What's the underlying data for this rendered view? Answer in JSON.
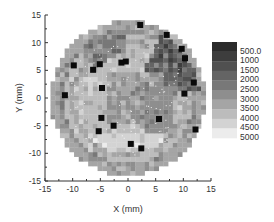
{
  "chart_data": {
    "type": "heatmap",
    "title": "",
    "xlabel": "X (mm)",
    "ylabel": "Y (mm)",
    "xlim": [
      -15,
      15
    ],
    "ylim": [
      -15,
      15
    ],
    "x_ticks": [
      -15,
      -10,
      -5,
      0,
      5,
      10,
      15
    ],
    "y_ticks": [
      -15,
      -10,
      -5,
      0,
      5,
      10,
      15
    ],
    "grid": false,
    "shape": "circular wafer map, radius ~14 mm, pixelated grayscale",
    "colorbar": {
      "position": "right",
      "levels": [
        "500.0",
        "1000",
        "1500",
        "2000",
        "2500",
        "3000",
        "3500",
        "4000",
        "4500",
        "5000"
      ],
      "colors": [
        "#2b2b2b",
        "#3d3d3d",
        "#505050",
        "#646464",
        "#787878",
        "#8e8e8e",
        "#a5a5a5",
        "#bcbcbc",
        "#d3d3d3",
        "#ececec"
      ]
    },
    "regions": [
      {
        "description": "outer rim rings",
        "value_range": [
          3000,
          4500
        ]
      },
      {
        "description": "upper-right dark sector",
        "value_range": [
          500,
          2000
        ]
      },
      {
        "description": "center band",
        "value_range": [
          2500,
          3500
        ]
      },
      {
        "description": "lower half light band",
        "value_range": [
          3500,
          4500
        ]
      }
    ],
    "markers": {
      "shape": "black square",
      "points": [
        {
          "x": 2.2,
          "y": 13.2
        },
        {
          "x": 7.0,
          "y": 11.4
        },
        {
          "x": 9.7,
          "y": 8.9
        },
        {
          "x": 10.3,
          "y": 7.2
        },
        {
          "x": -5.1,
          "y": 6.1
        },
        {
          "x": -1.2,
          "y": 6.4
        },
        {
          "x": -0.4,
          "y": 6.6
        },
        {
          "x": -9.8,
          "y": 5.9
        },
        {
          "x": -6.3,
          "y": 5.1
        },
        {
          "x": -11.4,
          "y": 0.5
        },
        {
          "x": -4.7,
          "y": 1.8
        },
        {
          "x": 11.9,
          "y": 2.8
        },
        {
          "x": 10.2,
          "y": 0.8
        },
        {
          "x": -4.8,
          "y": -3.6
        },
        {
          "x": -2.6,
          "y": -5.0
        },
        {
          "x": -5.3,
          "y": -6.0
        },
        {
          "x": 5.6,
          "y": -3.8
        },
        {
          "x": 12.2,
          "y": -5.7
        },
        {
          "x": 0.5,
          "y": -8.3
        },
        {
          "x": 2.4,
          "y": -9.1
        }
      ]
    }
  }
}
